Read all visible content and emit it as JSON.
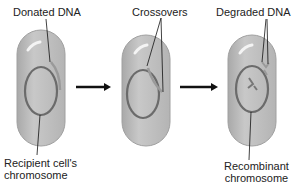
{
  "labels": {
    "donated_dna": "Donated DNA",
    "crossovers": "Crossovers",
    "degraded_dna": "Degraded DNA",
    "recipient_line1": "Recipient cell's",
    "recipient_line2": "chromosome",
    "recombinant_line1": "Recombinant",
    "recombinant_line2": "chromosome"
  },
  "colors": {
    "cell_fill": "#bdbdbd",
    "cell_stroke": "#a8a8a8",
    "chromosome": "#6b6b6b",
    "donor_dna": "#9a9a9a",
    "arrow": "#111111"
  },
  "stages": [
    "recipient",
    "crossover",
    "recombinant"
  ]
}
